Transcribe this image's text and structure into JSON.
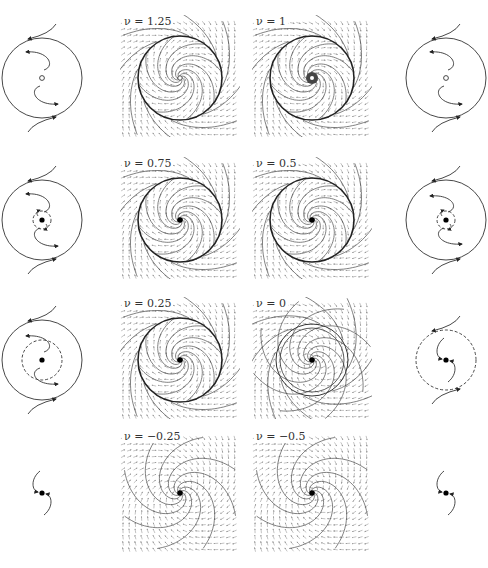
{
  "figure": {
    "colors": {
      "line": "#333333",
      "arrow_field": "#9a9a9a",
      "stream": "#444444",
      "background": "#ffffff"
    },
    "rows": [
      {
        "left": {
          "nu": "1.25",
          "label": "ν = 1.25",
          "center": "open",
          "inner_circle": "none",
          "outer_circle": "solid"
        },
        "right": {
          "nu": "1",
          "label": "ν = 1",
          "center": "open",
          "inner_circle": "none",
          "outer_circle": "solid"
        }
      },
      {
        "left": {
          "nu": "0.75",
          "label": "ν = 0.75",
          "center": "filled",
          "inner_circle": "dashed",
          "outer_circle": "solid"
        },
        "right": {
          "nu": "0.5",
          "label": "ν = 0.5",
          "center": "filled",
          "inner_circle": "dashed",
          "outer_circle": "solid"
        }
      },
      {
        "left": {
          "nu": "0.25",
          "label": "ν = 0.25",
          "center": "filled",
          "inner_circle": "dashed",
          "outer_circle": "solid"
        },
        "right": {
          "nu": "0",
          "label": "ν = 0",
          "center": "filled",
          "inner_circle": "none",
          "outer_circle": "dashed"
        }
      },
      {
        "left": {
          "nu": "-0.25",
          "label": "ν = −0.25",
          "center": "filled",
          "inner_circle": "none",
          "outer_circle": "none"
        },
        "right": {
          "nu": "-0.5",
          "label": "ν = −0.5",
          "center": "filled",
          "inner_circle": "none",
          "outer_circle": "none"
        }
      }
    ]
  },
  "labels": {
    "r0l": "ν = 1.25",
    "r0r": "ν = 1",
    "r1l": "ν = 0.75",
    "r1r": "ν = 0.5",
    "r2l": "ν = 0.25",
    "r2r": "ν = 0",
    "r3l": "ν = −0.25",
    "r3r": "ν = −0.5"
  }
}
